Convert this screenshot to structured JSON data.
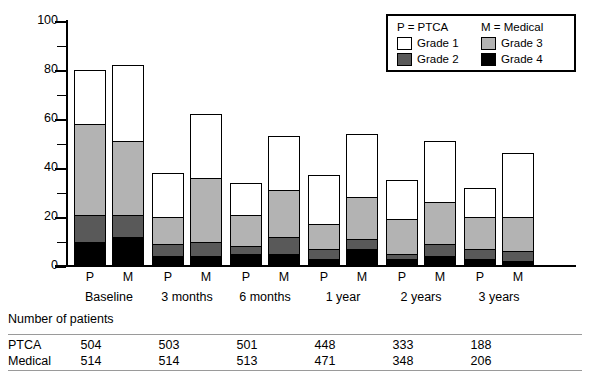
{
  "chart_data": {
    "type": "bar",
    "subtype": "stacked",
    "title": "",
    "xlabel": "",
    "ylabel": "Percentage",
    "ylim": [
      0,
      100
    ],
    "yticks": [
      0,
      20,
      40,
      60,
      80,
      100
    ],
    "yticks_minor": [
      10,
      30,
      50,
      70,
      90
    ],
    "grid": false,
    "legend_position": "top-right",
    "categories": [
      "Baseline",
      "3 months",
      "6 months",
      "1 year",
      "2 years",
      "3 years"
    ],
    "group_labels": [
      "P",
      "M"
    ],
    "series": [
      {
        "name": "Grade 1",
        "color": "#ffffff",
        "values_ptca": [
          22,
          18,
          13,
          20,
          16,
          12
        ],
        "values_medical": [
          31,
          26,
          22,
          26,
          25,
          26
        ]
      },
      {
        "name": "Grade 3",
        "color": "#b3b3b3",
        "values_ptca": [
          37,
          11,
          13,
          10,
          14,
          13
        ],
        "values_medical": [
          30,
          26,
          19,
          17,
          17,
          14
        ]
      },
      {
        "name": "Grade 2",
        "color": "#595959",
        "values_ptca": [
          11,
          5,
          3,
          4,
          2,
          4
        ],
        "values_medical": [
          9,
          6,
          7,
          4,
          5,
          4
        ]
      },
      {
        "name": "Grade 4",
        "color": "#000000",
        "values_ptca": [
          10,
          4,
          5,
          3,
          3,
          3
        ],
        "values_medical": [
          12,
          4,
          5,
          7,
          4,
          2
        ]
      }
    ],
    "totals_ptca": [
      80,
      38,
      34,
      37,
      35,
      32
    ],
    "totals_medical": [
      82,
      62,
      56,
      54,
      51,
      46
    ]
  },
  "axis": {
    "y_title": "Percentage",
    "y_tick_labels": [
      "0",
      "20",
      "40",
      "60",
      "80",
      "100"
    ]
  },
  "legend": {
    "header_left": "P = PTCA",
    "header_right": "M = Medical",
    "items": [
      {
        "label": "Grade 1",
        "swatch": "sw-g1"
      },
      {
        "label": "Grade 3",
        "swatch": "sw-g3"
      },
      {
        "label": "Grade 2",
        "swatch": "sw-g2"
      },
      {
        "label": "Grade 4",
        "swatch": "sw-g4"
      }
    ]
  },
  "xaxis": {
    "pm_labels": [
      "P",
      "M",
      "P",
      "M",
      "P",
      "M",
      "P",
      "M",
      "P",
      "M",
      "P",
      "M"
    ],
    "group_labels": [
      "Baseline",
      "3 months",
      "6 months",
      "1 year",
      "2 years",
      "3 years"
    ]
  },
  "table": {
    "title": "Number of patients",
    "rows": [
      {
        "label": "PTCA",
        "values": [
          "504",
          "503",
          "501",
          "448",
          "333",
          "188"
        ]
      },
      {
        "label": "Medical",
        "values": [
          "514",
          "514",
          "513",
          "471",
          "348",
          "206"
        ]
      }
    ]
  }
}
